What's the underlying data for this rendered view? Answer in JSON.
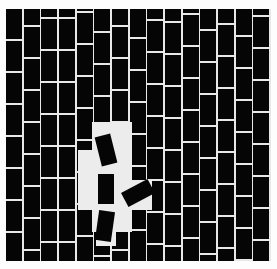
{
  "image": {
    "description": "Illustration of a black brick wall with white grout; several bricks in the lower middle have come loose and are tilted/falling out, leaving a light gap.",
    "colors": {
      "brick": "#050505",
      "grout": "#e8e8e8",
      "background": "#fdfdfd",
      "gap": "#ececec"
    },
    "wall": {
      "columns": 15,
      "brick_width": 16,
      "brick_height": 30,
      "grout": 2
    },
    "column_offsets": [
      0,
      -14,
      10,
      -22,
      4,
      -8,
      18,
      -2,
      12,
      -18,
      6,
      -10,
      16,
      -4,
      8
    ],
    "loose_bricks": [
      {
        "x": 98,
        "y": 135,
        "rot": -14
      },
      {
        "x": 98,
        "y": 174,
        "rot": 0
      },
      {
        "x": 130,
        "y": 178,
        "rot": 62
      },
      {
        "x": 97,
        "y": 211,
        "rot": 8
      }
    ]
  }
}
